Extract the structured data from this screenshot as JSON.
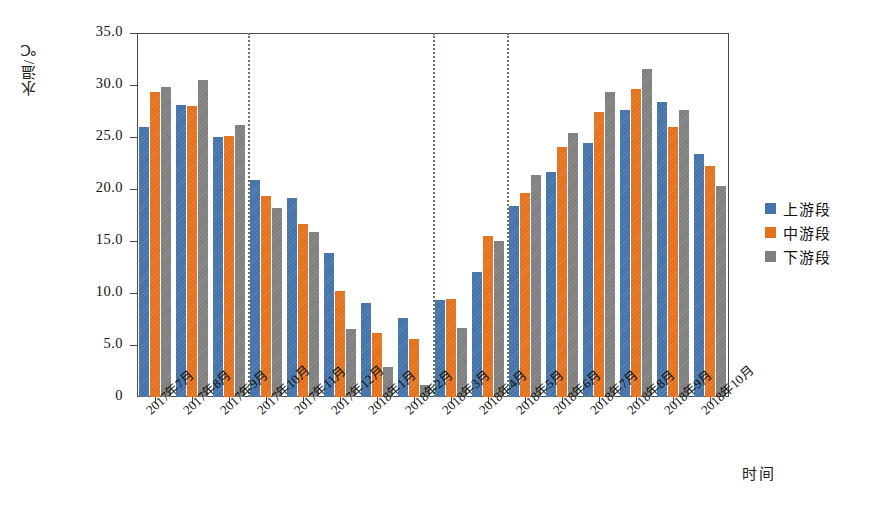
{
  "chart_data": {
    "type": "bar",
    "title": "",
    "xlabel": "时间",
    "ylabel": "水温/℃",
    "ylim": [
      0,
      35
    ],
    "ytick_labels": [
      "0",
      "5.0",
      "10.0",
      "15.0",
      "20.0",
      "25.0",
      "30.0",
      "35.0"
    ],
    "ytick_values": [
      0,
      5,
      10,
      15,
      20,
      25,
      30,
      35
    ],
    "grid": false,
    "legend_position": "right",
    "categories": [
      "2017年7月",
      "2017年8月",
      "2017年9月",
      "2017年10月",
      "2017年11月",
      "2017年12月",
      "2018年1月",
      "2018年2月",
      "2018年3月",
      "2018年4月",
      "2018年5月",
      "2018年6月",
      "2018年7月",
      "2018年8月",
      "2018年9月",
      "2018年10月"
    ],
    "series": [
      {
        "name": "上游段",
        "color": "#4373a8",
        "values": [
          26.0,
          28.1,
          25.0,
          20.9,
          19.1,
          13.8,
          9.0,
          7.6,
          9.3,
          12.0,
          18.4,
          21.6,
          24.4,
          27.6,
          28.4,
          23.4
        ]
      },
      {
        "name": "中游段",
        "color": "#e3711d",
        "values": [
          29.3,
          28.0,
          25.1,
          19.3,
          16.6,
          10.2,
          6.2,
          5.6,
          9.4,
          15.5,
          19.6,
          24.0,
          27.4,
          29.6,
          26.0,
          22.2
        ]
      },
      {
        "name": "下游段",
        "color": "#7f7f7f",
        "values": [
          29.8,
          30.5,
          26.2,
          18.2,
          15.9,
          6.5,
          2.9,
          1.2,
          6.6,
          15.0,
          21.3,
          25.4,
          29.3,
          31.5,
          27.6,
          20.3
        ]
      }
    ],
    "dividers_after_category": [
      "2017年9月",
      "2018年2月",
      "2018年4月"
    ],
    "divider_color": "#6d7a4f",
    "frame_color": "#4a4a4a"
  },
  "legend": {
    "items": [
      {
        "label": "上游段",
        "color": "#4373a8"
      },
      {
        "label": "中游段",
        "color": "#e3711d"
      },
      {
        "label": "下游段",
        "color": "#7f7f7f"
      }
    ]
  },
  "axes": {
    "y_title": "水温/℃",
    "x_title": "时间"
  }
}
